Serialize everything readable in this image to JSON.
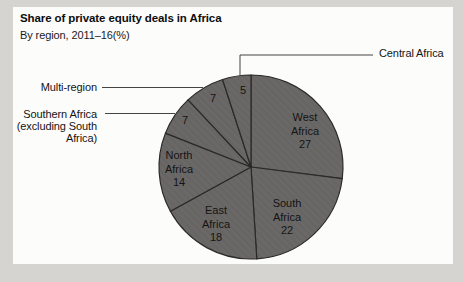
{
  "header": {
    "title": "Share of private equity deals in Africa",
    "subtitle": "By region, 2011–16(%)"
  },
  "chart_data": {
    "type": "pie",
    "title": "Share of private equity deals in Africa",
    "subtitle": "By region, 2011–16(%)",
    "unit": "percent of deals",
    "direction": "clockwise",
    "start_angle": "12 o'clock",
    "legend_position": "none (direct labels: values inside slices, names inside large slices, callout lines to outside names for small slices)",
    "slices": [
      {
        "label": "West Africa",
        "value": 27,
        "label_placement": "inside"
      },
      {
        "label": "South Africa",
        "value": 22,
        "label_placement": "inside"
      },
      {
        "label": "East Africa",
        "value": 18,
        "label_placement": "inside"
      },
      {
        "label": "North Africa",
        "value": 14,
        "label_placement": "inside"
      },
      {
        "label": "Southern Africa (excluding South Africa)",
        "value": 7,
        "label_placement": "callout-left",
        "callout_lines": [
          "Southern Africa",
          "(excluding South",
          "Africa)"
        ]
      },
      {
        "label": "Multi-region",
        "value": 7,
        "label_placement": "callout-left",
        "callout_lines": [
          "Multi-region"
        ]
      },
      {
        "label": "Central Africa",
        "value": 5,
        "label_placement": "callout-right",
        "callout_lines": [
          "Central Africa"
        ]
      }
    ],
    "colors": {
      "page_background": "#d6d4d1",
      "card_background": "#fcfcfb",
      "slice_fill": "#6b6967",
      "slice_stroke": "#2b2928",
      "callout_line": "#444444",
      "text": "#141414"
    }
  }
}
